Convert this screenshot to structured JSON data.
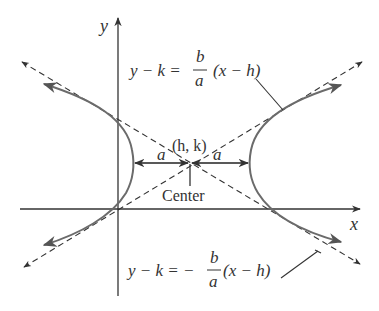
{
  "diagram": {
    "axes": {
      "x_label": "x",
      "y_label": "y"
    },
    "center": {
      "label": "(h, k)",
      "caption": "Center"
    },
    "distances": {
      "left_label": "a",
      "right_label": "a"
    },
    "asymptotes": {
      "upper": {
        "lhs": "y − k = ",
        "num": "b",
        "den": "a",
        "rhs": "(x − h)"
      },
      "lower": {
        "lhs": "y − k = −",
        "num": "b",
        "den": "a",
        "rhs": "(x − h)"
      }
    },
    "colors": {
      "curve": "#6b6b6b",
      "lines": "#333333",
      "background": "#ffffff"
    }
  }
}
